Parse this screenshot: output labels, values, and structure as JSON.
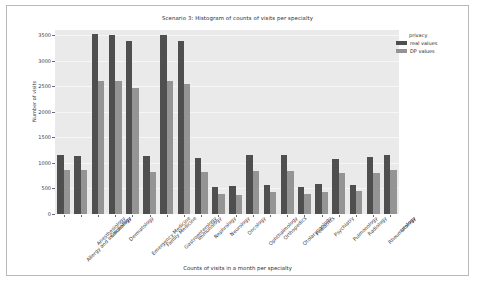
{
  "chart_data": {
    "type": "bar",
    "title": "Scenario 3: Histogram of counts of visits per specialty",
    "xlabel": "Counts of visits in a month per specialty",
    "ylabel": "Number of visits",
    "ylim": [
      0,
      3600
    ],
    "yticks": [
      0,
      500,
      1000,
      1500,
      2000,
      2500,
      3000,
      3500
    ],
    "grid": true,
    "legend": {
      "title": "privacy",
      "position": "upper right",
      "entries": [
        {
          "label": "real values",
          "color": "#4f4f4f"
        },
        {
          "label": "DP values",
          "color": "#949494"
        }
      ]
    },
    "categories": [
      "Allergy and Immunology",
      "Anesthesiology",
      "Cardiology",
      "Dermatology",
      "Emergency Medicine",
      "Family Medicine",
      "Gastroenterology",
      "Immunology",
      "Nephrology",
      "Neurology",
      "Oncology",
      "Ophthalmology",
      "Orthopedics",
      "Otolaryngology",
      "Pediatrics",
      "Psychiatry",
      "Pulmonology",
      "Radiology",
      "Rheumatology",
      "Urology"
    ],
    "series": [
      {
        "name": "real values",
        "color": "#4f4f4f",
        "values": [
          1150,
          1130,
          3530,
          3510,
          3390,
          1130,
          3510,
          3380,
          1090,
          535,
          540,
          1150,
          560,
          1160,
          535,
          580,
          1080,
          560,
          1115,
          1150
        ]
      },
      {
        "name": "DP values",
        "color": "#949494",
        "values": [
          865,
          855,
          2610,
          2600,
          2470,
          830,
          2600,
          2545,
          825,
          400,
          370,
          850,
          440,
          845,
          385,
          435,
          810,
          455,
          805,
          865
        ]
      }
    ]
  }
}
